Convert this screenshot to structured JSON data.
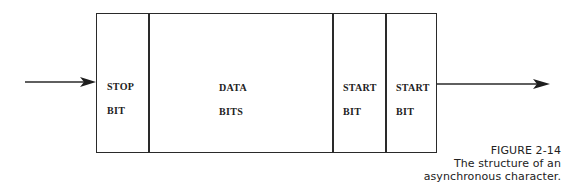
{
  "figure": {
    "number": "FIGURE 2-14",
    "caption_line1": "The structure of an",
    "caption_line2": "asynchronous character."
  },
  "cells": [
    {
      "id": "stop-bit",
      "line1": "STOP",
      "line2": "BIT"
    },
    {
      "id": "data-bits",
      "line1": "DATA",
      "line2": "BITS"
    },
    {
      "id": "start-bit-1",
      "line1": "START",
      "line2": "BIT"
    },
    {
      "id": "start-bit-2",
      "line1": "START",
      "line2": "BIT"
    }
  ],
  "arrows": {
    "input": "arrow-into-frame",
    "output": "arrow-out-of-frame"
  },
  "colors": {
    "stroke": "#2a2a2a",
    "text": "#222222",
    "background": "#ffffff"
  }
}
